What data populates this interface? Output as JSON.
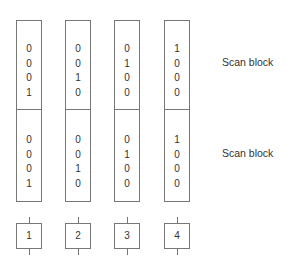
{
  "diagram": {
    "columns": [
      {
        "id": 1,
        "top_bits": [
          "0",
          "0",
          "0",
          "1"
        ],
        "bottom_bits": [
          "0",
          "0",
          "0",
          "1"
        ]
      },
      {
        "id": 2,
        "top_bits": [
          "0",
          "0",
          "1",
          "0"
        ],
        "bottom_bits": [
          "0",
          "0",
          "1",
          "0"
        ]
      },
      {
        "id": 3,
        "top_bits": [
          "0",
          "1",
          "0",
          "0"
        ],
        "bottom_bits": [
          "0",
          "1",
          "0",
          "0"
        ]
      },
      {
        "id": 4,
        "top_bits": [
          "1",
          "0",
          "0",
          "0"
        ],
        "bottom_bits": [
          "1",
          "0",
          "0",
          "0"
        ]
      }
    ],
    "labels": {
      "top": "Scan block",
      "bottom": "Scan block"
    },
    "boxes": [
      "1",
      "2",
      "3",
      "4"
    ]
  }
}
